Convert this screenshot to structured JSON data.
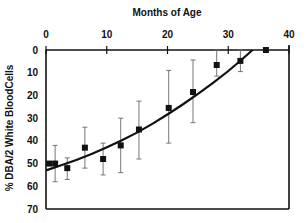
{
  "chart_data": {
    "type": "scatter",
    "title": "Months of Age",
    "xlabel": "Months of Age",
    "ylabel": "% DBA/2 White BloodCells",
    "x_axis_position": "top",
    "y_axis_inverted": true,
    "xlim": [
      0,
      40
    ],
    "ylim": [
      0,
      70
    ],
    "x_ticks": [
      0,
      10,
      20,
      30,
      40
    ],
    "y_ticks": [
      0,
      10,
      20,
      30,
      40,
      50,
      60,
      70
    ],
    "grid": false,
    "legend": null,
    "series": [
      {
        "name": "Observed",
        "marker": "square",
        "points": [
          {
            "x": 0.5,
            "y": 50,
            "err_low": null,
            "err_high": null
          },
          {
            "x": 1.5,
            "y": 50,
            "err_low": 42,
            "err_high": 58
          },
          {
            "x": 3.5,
            "y": 52,
            "err_low": 47.5,
            "err_high": 57
          },
          {
            "x": 6.4,
            "y": 43,
            "err_low": 34,
            "err_high": 52
          },
          {
            "x": 9.4,
            "y": 48,
            "err_low": 41,
            "err_high": 55
          },
          {
            "x": 12.3,
            "y": 42,
            "err_low": 30,
            "err_high": 54
          },
          {
            "x": 15.3,
            "y": 35,
            "err_low": 22.5,
            "err_high": 48
          },
          {
            "x": 20.2,
            "y": 25.5,
            "err_low": 9,
            "err_high": 41
          },
          {
            "x": 24.2,
            "y": 18.5,
            "err_low": 4.4,
            "err_high": 32
          },
          {
            "x": 28.1,
            "y": 6.6,
            "err_low": 0,
            "err_high": 11.5
          },
          {
            "x": 32.0,
            "y": 4.8,
            "err_low": 0,
            "err_high": 9.5
          },
          {
            "x": 36.2,
            "y": 0,
            "err_low": null,
            "err_high": null
          }
        ]
      },
      {
        "name": "Fitted curve",
        "type": "line",
        "points": [
          {
            "x": 0,
            "y": 53
          },
          {
            "x": 5,
            "y": 48.5
          },
          {
            "x": 10,
            "y": 43
          },
          {
            "x": 15,
            "y": 36.5
          },
          {
            "x": 20,
            "y": 28.5
          },
          {
            "x": 25,
            "y": 19.5
          },
          {
            "x": 30,
            "y": 9.5
          },
          {
            "x": 34,
            "y": 0
          }
        ]
      }
    ]
  }
}
